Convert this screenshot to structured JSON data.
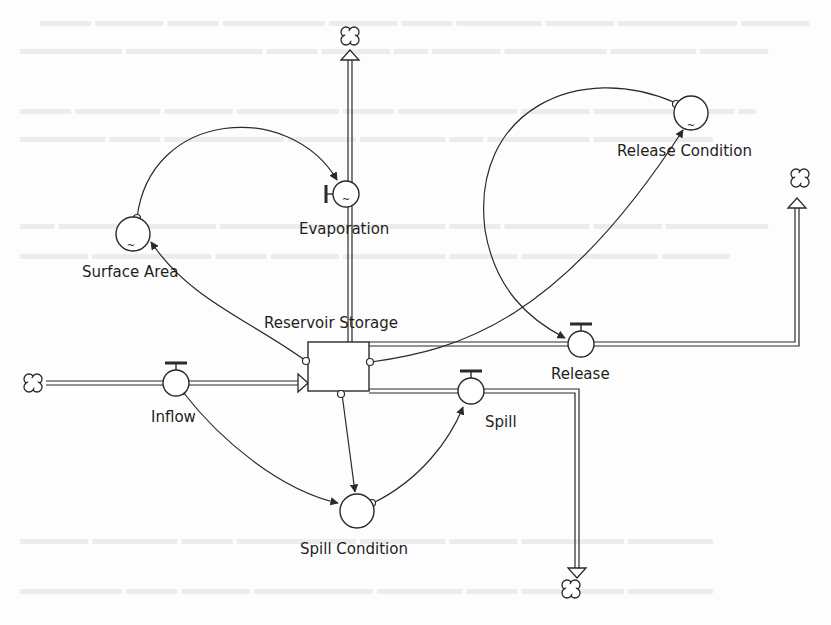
{
  "diagram": {
    "type": "stock-and-flow",
    "stock": {
      "id": "reservoir-storage",
      "label": "Reservoir Storage"
    },
    "flows": [
      {
        "id": "inflow",
        "label": "Inflow",
        "from": "cloud-source",
        "to": "reservoir-storage"
      },
      {
        "id": "evaporation",
        "label": "Evaporation",
        "from": "reservoir-storage",
        "to": "cloud-sink-top"
      },
      {
        "id": "release",
        "label": "Release",
        "from": "reservoir-storage",
        "to": "cloud-sink-right"
      },
      {
        "id": "spill",
        "label": "Spill",
        "from": "reservoir-storage",
        "to": "cloud-sink-bottom"
      }
    ],
    "converters": [
      {
        "id": "surface-area",
        "label": "Surface Area",
        "graphical": true
      },
      {
        "id": "release-condition",
        "label": "Release Condition",
        "graphical": true
      },
      {
        "id": "spill-condition",
        "label": "Spill Condition",
        "graphical": false
      }
    ],
    "connectors": [
      {
        "from": "reservoir-storage",
        "to": "surface-area"
      },
      {
        "from": "surface-area",
        "to": "evaporation"
      },
      {
        "from": "reservoir-storage",
        "to": "release-condition"
      },
      {
        "from": "release-condition",
        "to": "release"
      },
      {
        "from": "reservoir-storage",
        "to": "spill-condition"
      },
      {
        "from": "inflow",
        "to": "spill-condition"
      },
      {
        "from": "spill-condition",
        "to": "spill"
      }
    ]
  },
  "labels": {
    "reservoir_storage": "Reservoir Storage",
    "evaporation": "Evaporation",
    "surface_area": "Surface Area",
    "release_condition": "Release Condition",
    "release": "Release",
    "inflow": "Inflow",
    "spill": "Spill",
    "spill_condition": "Spill Condition"
  },
  "graphical_marker": "~",
  "colors": {
    "line": "#2a2a2a",
    "background": "#fdfdfd",
    "bleed_text": "#ececec"
  }
}
